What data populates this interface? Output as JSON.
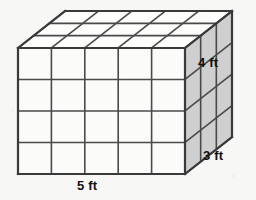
{
  "figure": {
    "shape": "rectangular-prism",
    "unit": "ft",
    "dimensions": {
      "width": 5,
      "depth": 3,
      "height": 4
    },
    "unit_cubes": {
      "front_face_columns": 5,
      "front_face_rows": 4,
      "right_face_columns": 3,
      "right_face_rows": 4,
      "top_face_columns": 5,
      "top_face_rows": 3
    },
    "labels": {
      "width": "5 ft",
      "depth": "3 ft",
      "height": "4 ft"
    },
    "colors": {
      "background": "#f7f7f5",
      "outline": "#3a3a3a",
      "grid_line": "#4a4a4a",
      "front_face_fill": "#fbfbfa",
      "top_face_fill": "#fdfdfc",
      "right_face_fill": "#cfcfcf",
      "label_text": "#111111"
    },
    "projection": {
      "front_left_x": 18,
      "front_top_y": 48,
      "front_right_x": 185,
      "front_bottom_y": 174,
      "depth_offset_x": 47,
      "depth_offset_y": -37
    }
  }
}
